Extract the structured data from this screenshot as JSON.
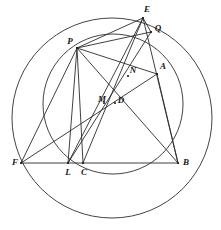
{
  "figure": {
    "width": 221,
    "height": 230,
    "background_color": "#ffffff",
    "stroke_color": "#2b2b30",
    "label_color": "#17171a"
  },
  "points": [
    {
      "id": "E",
      "label": "E",
      "x": 143.0,
      "y": 18.0,
      "label_x": 147.0,
      "label_y": 9.0
    },
    {
      "id": "Q",
      "label": "Q",
      "x": 151.0,
      "y": 32.0,
      "label_x": 158.0,
      "label_y": 28.0
    },
    {
      "id": "P",
      "label": "P",
      "x": 77.0,
      "y": 48.0,
      "label_x": 70.0,
      "label_y": 41.0
    },
    {
      "id": "A",
      "label": "A",
      "x": 157.0,
      "y": 74.0,
      "label_x": 163.0,
      "label_y": 66.0
    },
    {
      "id": "N",
      "label": "N",
      "x": 128.0,
      "y": 76.0,
      "label_x": 133.0,
      "label_y": 70.0
    },
    {
      "id": "M",
      "label": "M",
      "x": 104.0,
      "y": 103.0,
      "label_x": 102.0,
      "label_y": 99.0
    },
    {
      "id": "D",
      "label": "D",
      "x": 115.0,
      "y": 103.0,
      "label_x": 121.0,
      "label_y": 100.0
    },
    {
      "id": "F",
      "label": "F",
      "x": 21.0,
      "y": 163.0,
      "label_x": 15.0,
      "label_y": 162.0
    },
    {
      "id": "L",
      "label": "L",
      "x": 68.0,
      "y": 163.0,
      "label_x": 68.0,
      "label_y": 172.0
    },
    {
      "id": "C",
      "label": "C",
      "x": 83.0,
      "y": 163.0,
      "label_x": 84.0,
      "label_y": 172.0
    },
    {
      "id": "B",
      "label": "B",
      "x": 178.0,
      "y": 163.0,
      "label_x": 186.0,
      "label_y": 162.0
    }
  ],
  "circles": [
    {
      "id": "big-circle",
      "name": "large-circumcircle",
      "cx": 112.0,
      "cy": 118.0,
      "r": 100.0
    },
    {
      "id": "small-circle",
      "name": "smaller-circle",
      "cx": 113.0,
      "cy": 104.0,
      "r": 70.0
    }
  ],
  "segments": [
    {
      "id": "s-F-B",
      "from": "F",
      "to": "B",
      "name": "segment-F-B"
    },
    {
      "id": "s-F-A",
      "from": "F",
      "to": "A",
      "name": "segment-F-A"
    },
    {
      "id": "s-F-P",
      "from": "F",
      "to": "P",
      "name": "segment-F-P"
    },
    {
      "id": "s-P-E",
      "from": "P",
      "to": "E",
      "name": "segment-P-E"
    },
    {
      "id": "s-P-Q",
      "from": "P",
      "to": "Q",
      "name": "segment-P-Q"
    },
    {
      "id": "s-P-A",
      "from": "P",
      "to": "A",
      "name": "segment-P-A"
    },
    {
      "id": "s-P-L",
      "from": "P",
      "to": "L",
      "name": "segment-P-L"
    },
    {
      "id": "s-P-C",
      "from": "P",
      "to": "C",
      "name": "segment-P-C"
    },
    {
      "id": "s-P-B",
      "from": "P",
      "to": "B",
      "name": "segment-P-B"
    },
    {
      "id": "s-E-L",
      "from": "E",
      "to": "L",
      "name": "segment-E-L"
    },
    {
      "id": "s-E-C",
      "from": "E",
      "to": "C",
      "name": "segment-E-C"
    },
    {
      "id": "s-E-B",
      "from": "E",
      "to": "B",
      "name": "segment-E-B"
    },
    {
      "id": "s-Q-L",
      "from": "Q",
      "to": "L",
      "name": "segment-Q-L"
    },
    {
      "id": "s-A-B",
      "from": "A",
      "to": "B",
      "name": "segment-A-B"
    },
    {
      "id": "s-E-Q",
      "from": "E",
      "to": "Q",
      "name": "segment-E-Q"
    }
  ]
}
